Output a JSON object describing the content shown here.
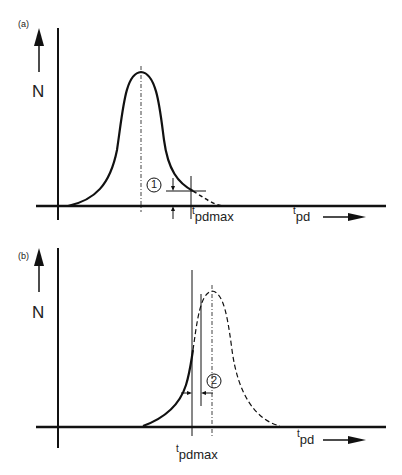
{
  "figure": {
    "panels": [
      {
        "id": "a",
        "label": "(a)",
        "y_axis_label": "N",
        "x_axis_label_t": "t",
        "x_axis_label_sub": "pd",
        "marker_label": "1",
        "threshold_label_t": "t",
        "threshold_label_sub": "pdmax",
        "description": "Distribution fully to the left of t_pdmax; small tail beyond threshold (dashed)"
      },
      {
        "id": "b",
        "label": "(b)",
        "y_axis_label": "N",
        "x_axis_label_t": "t",
        "x_axis_label_sub": "pd",
        "marker_label": "2",
        "threshold_label_t": "t",
        "threshold_label_sub": "pdmax",
        "description": "Distribution peak beyond t_pdmax; portion above threshold dashed"
      }
    ],
    "colors": {
      "line": "#111111",
      "background": "#ffffff"
    }
  }
}
